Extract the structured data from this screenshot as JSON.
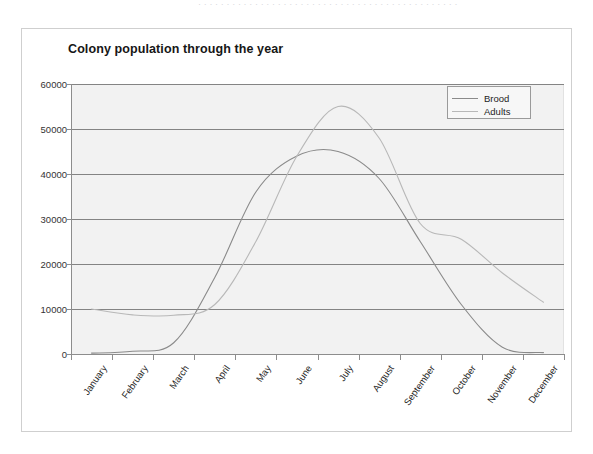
{
  "page": {
    "top_cut_text": "· · · · · · · · · · · · · · · · · · · · · · · · · · · · · · · · · · · · · · · · · · · · · ·"
  },
  "chart": {
    "title": "Colony population through the year",
    "legend": {
      "position": "top-right",
      "entries": [
        {
          "label": "Brood",
          "color": "#8a8a8a"
        },
        {
          "label": "Adults",
          "color": "#b8b8b8"
        }
      ]
    },
    "plot_background": "#f2f2f2",
    "gridline_color": "#848484",
    "axis_color": "#8d8d8d",
    "frame_border_color": "#cfcfcf"
  },
  "chart_data": {
    "type": "line",
    "title": "Colony population through the year",
    "xlabel": "",
    "ylabel": "",
    "categories": [
      "January",
      "February",
      "March",
      "April",
      "May",
      "June",
      "July",
      "August",
      "September",
      "October",
      "November",
      "December"
    ],
    "x_tick_labels": [
      "January",
      "February",
      "March",
      "April",
      "May",
      "June",
      "July",
      "August",
      "September",
      "October",
      "November",
      "December"
    ],
    "y_tick_labels": [
      "0",
      "10000",
      "20000",
      "30000",
      "40000",
      "50000",
      "60000"
    ],
    "y_ticks": [
      0,
      10000,
      20000,
      30000,
      40000,
      50000,
      60000
    ],
    "ylim": [
      0,
      60000
    ],
    "grid": "horizontal",
    "legend_position": "top-right",
    "series": [
      {
        "name": "Brood",
        "color": "#8a8a8a",
        "values": [
          200,
          600,
          2500,
          17000,
          36000,
          44000,
          45000,
          39000,
          25000,
          11000,
          1500,
          300
        ]
      },
      {
        "name": "Adults",
        "color": "#b8b8b8",
        "values": [
          10000,
          8700,
          8600,
          11000,
          25000,
          44000,
          55000,
          48000,
          29000,
          25500,
          18000,
          11500
        ]
      }
    ]
  }
}
